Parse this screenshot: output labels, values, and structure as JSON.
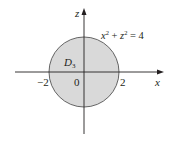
{
  "diagram": {
    "equation": {
      "lhs_x": "x",
      "sup1": "2",
      "plus": " + ",
      "lhs_z": "z",
      "sup2": "2",
      "rhs": " = 4"
    },
    "region_label": {
      "main": "D",
      "sub": "3"
    },
    "axes": {
      "horizontal_label": "x",
      "vertical_label": "z"
    },
    "ticks": {
      "neg2": "−2",
      "origin": "0",
      "pos2": "2"
    },
    "colors": {
      "fill": "#d9d9d9",
      "stroke": "#555555",
      "axis": "#231f20"
    }
  }
}
